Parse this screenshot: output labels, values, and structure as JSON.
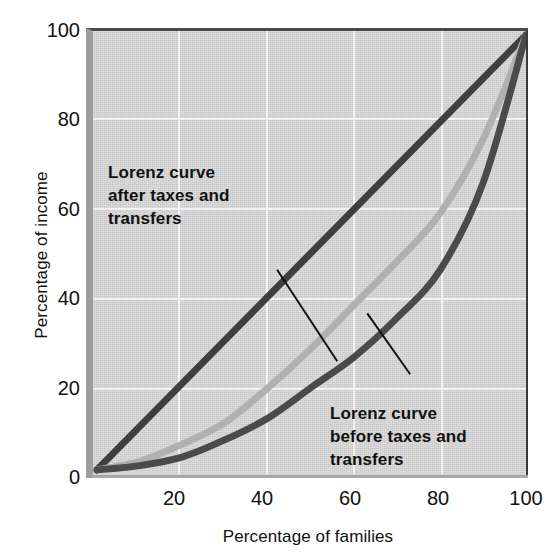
{
  "chart_data": {
    "type": "line",
    "title": "",
    "xlabel": "Percentage of families",
    "ylabel": "Percentage of income",
    "xlim": [
      0,
      100
    ],
    "ylim": [
      0,
      100
    ],
    "xticks": [
      20,
      40,
      60,
      80,
      100
    ],
    "yticks": [
      0,
      20,
      40,
      60,
      80,
      100
    ],
    "grid": true,
    "legend_position": "inline-annotations",
    "plot_background_color": "#c9c9c9",
    "gridline_color": "#f2f2f2",
    "series": [
      {
        "name": "Line of perfect equality",
        "color": "#3f3f3f",
        "x": [
          0,
          100
        ],
        "values": [
          0,
          100
        ]
      },
      {
        "name": "Lorenz curve after taxes and transfers",
        "color": "#b0b0b0",
        "x": [
          0,
          10,
          20,
          30,
          40,
          50,
          60,
          70,
          80,
          90,
          100
        ],
        "values": [
          0,
          2,
          6,
          11,
          19,
          28,
          38,
          48,
          59,
          76,
          100
        ]
      },
      {
        "name": "Lorenz curve before taxes and transfers",
        "color": "#4a4a4a",
        "x": [
          0,
          10,
          20,
          30,
          40,
          50,
          60,
          70,
          80,
          90,
          100
        ],
        "values": [
          0,
          1,
          3,
          7,
          12,
          19,
          26,
          35,
          46,
          66,
          100
        ]
      }
    ],
    "annotations": [
      {
        "name": "after-taxes-label",
        "text": "Lorenz curve after taxes and transfers",
        "line1": "Lorenz curve",
        "line2": "after taxes and",
        "line3": "transfers",
        "leader_from": [
          42,
          46
        ],
        "leader_to": [
          56,
          25
        ]
      },
      {
        "name": "before-taxes-label",
        "text": "Lorenz curve before taxes and transfers",
        "line1": "Lorenz curve",
        "line2": "before taxes and",
        "line3": "transfers",
        "leader_from": [
          73,
          22
        ],
        "leader_to": [
          63,
          36
        ]
      }
    ]
  },
  "axes": {
    "ylabel": "Percentage of income",
    "xlabel": "Percentage of families",
    "yticks": [
      "100",
      "80",
      "60",
      "40",
      "20",
      "0"
    ],
    "xticks": [
      "20",
      "40",
      "60",
      "80",
      "100"
    ]
  },
  "annotations": {
    "after": {
      "line1": "Lorenz curve",
      "line2": "after taxes and",
      "line3": "transfers"
    },
    "before": {
      "line1": "Lorenz curve",
      "line2": "before taxes and",
      "line3": "transfers"
    }
  }
}
